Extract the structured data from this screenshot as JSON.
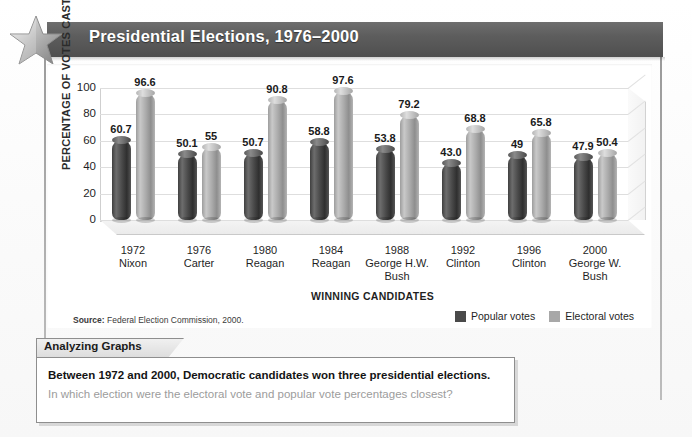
{
  "banner": {
    "title": "Presidential Elections, 1976–2000"
  },
  "chart_data": {
    "type": "bar",
    "title": "Presidential Elections, 1976–2000",
    "xlabel": "WINNING CANDIDATES",
    "ylabel": "PERCENTAGE OF VOTES CAST",
    "ylim": [
      0,
      100
    ],
    "yticks": [
      100,
      80,
      60,
      40,
      20,
      0
    ],
    "grid": true,
    "legend_position": "bottom-right",
    "categories": [
      "1972",
      "1976",
      "1980",
      "1984",
      "1988",
      "1992",
      "1996",
      "2000"
    ],
    "candidates": [
      "Nixon",
      "Carter",
      "Reagan",
      "Reagan",
      "George H.W. Bush",
      "Clinton",
      "Clinton",
      "George W. Bush"
    ],
    "series": [
      {
        "name": "Popular votes",
        "color": "#4a4a4a",
        "values": [
          60.7,
          50.1,
          50.7,
          58.8,
          53.8,
          43.0,
          49,
          47.9
        ],
        "labels": [
          "60.7",
          "50.1",
          "50.7",
          "58.8",
          "53.8",
          "43.0",
          "49",
          "47.9"
        ]
      },
      {
        "name": "Electoral votes",
        "color": "#a8a8a8",
        "values": [
          96.6,
          55,
          90.8,
          97.6,
          79.2,
          68.8,
          65.8,
          50.4
        ],
        "labels": [
          "96.6",
          "55",
          "90.8",
          "97.6",
          "79.2",
          "68.8",
          "65.8",
          "50.4"
        ]
      }
    ]
  },
  "legend": [
    {
      "label": "Popular votes",
      "swatch": "pop"
    },
    {
      "label": "Electoral votes",
      "swatch": "ele"
    }
  ],
  "source": {
    "prefix": "Source:",
    "text": " Federal Election Commission, 2000."
  },
  "analyzing": {
    "tab_label": "Analyzing Graphs",
    "bold_text": "Between 1972 and 2000, Democratic candidates won three presidential elections.",
    "question_text": " In which election were the electoral vote and popular vote percentages closest?"
  },
  "icons": {
    "star": "star-icon"
  }
}
